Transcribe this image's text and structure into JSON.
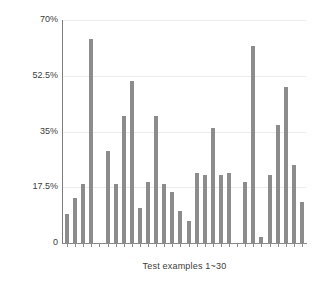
{
  "chart_data": {
    "type": "bar",
    "title": "",
    "subtitle": "",
    "xlabel": "Test examples 1~30",
    "ylabel": "comp",
    "grid": true,
    "legend": null,
    "bar_color": "#8c8c8c",
    "axis_color": "#8a8a8a",
    "ylim": [
      0,
      70
    ],
    "yticks": [
      0,
      17.5,
      35,
      52.5,
      70
    ],
    "ytick_labels": [
      "0",
      "17.5%",
      "35%",
      "52.5%",
      "70%"
    ],
    "categories": [
      "1",
      "2",
      "3",
      "4",
      "5",
      "6",
      "7",
      "8",
      "9",
      "10",
      "11",
      "12",
      "13",
      "14",
      "15",
      "16",
      "17",
      "18",
      "19",
      "20",
      "21",
      "22",
      "23",
      "24",
      "25",
      "26",
      "27",
      "28",
      "29",
      "30"
    ],
    "values": [
      9.0,
      14.0,
      18.5,
      64.0,
      0.0,
      29.0,
      18.5,
      40.0,
      51.0,
      11.0,
      19.0,
      40.0,
      18.5,
      16.0,
      10.0,
      7.0,
      22.0,
      21.5,
      36.0,
      21.5,
      22.0,
      0.0,
      19.0,
      62.0,
      2.0,
      21.5,
      37.0,
      49.0,
      24.5,
      13.0
    ],
    "value_unit": "%",
    "n_bars": 30
  },
  "axes": {
    "y_axis_name": "y-axis",
    "x_axis_name": "x-axis"
  }
}
